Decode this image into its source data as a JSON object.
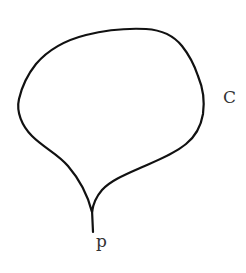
{
  "diagram": {
    "type": "closed-curve-with-cusp",
    "curve": {
      "label": "C",
      "stroke_color": "#111111"
    },
    "cusp_point": {
      "label": "p"
    },
    "background": "#ffffff"
  }
}
